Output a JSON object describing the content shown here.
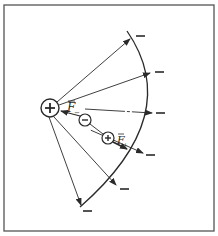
{
  "figure": {
    "frame": {
      "x": 4,
      "y": 5,
      "width": 210,
      "height": 226,
      "color": "#555555"
    },
    "colors": {
      "ink": "#2a2a2a",
      "background": "#ffffff"
    },
    "source_charge": {
      "sign": "+",
      "cx": 50,
      "cy": 108,
      "r": 9
    },
    "arc": {
      "start": [
        127,
        31
      ],
      "end": [
        80,
        207
      ],
      "control": [
        185,
        115
      ]
    },
    "field_lines": [
      {
        "tip": [
          130,
          39
        ],
        "minus_at": [
          139,
          36
        ]
      },
      {
        "tip": [
          150,
          73
        ],
        "minus_at": [
          159,
          72
        ]
      },
      {
        "tip": [
          152,
          113
        ],
        "minus_at": [
          160,
          113
        ]
      },
      {
        "tip": [
          143,
          153
        ],
        "minus_at": [
          150,
          155
        ]
      },
      {
        "tip": [
          116,
          185
        ],
        "minus_at": [
          124,
          189
        ]
      },
      {
        "tip": [
          81,
          205
        ],
        "minus_at": [
          87,
          211
        ]
      }
    ],
    "minus_label": "—",
    "dipole": {
      "negative": {
        "sign": "−",
        "cx": 85,
        "cy": 120,
        "r": 6
      },
      "positive": {
        "sign": "+",
        "cx": 108,
        "cy": 138,
        "r": 6
      }
    },
    "forces": {
      "f_minus": {
        "label": "F",
        "subscript": "−",
        "label_x": 68,
        "label_y": 111
      },
      "f_plus": {
        "label": "F",
        "subscript": "+",
        "label_x": 117,
        "label_y": 143
      }
    }
  }
}
